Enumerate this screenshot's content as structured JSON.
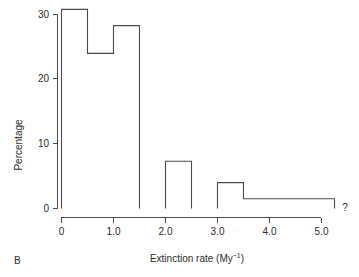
{
  "figure": {
    "panel_label": "B",
    "uncertainty_marker": "?"
  },
  "chart_data": {
    "type": "bar",
    "title": "",
    "subtitle": "",
    "xlabel": "Extinction rate (My⁻¹)",
    "ylabel": "Percentage",
    "xlabel_parts": {
      "main": "Extinction rate (My",
      "superscript": "−1",
      "tail": ")"
    },
    "style": "histogram-outline",
    "grid": false,
    "legend": null,
    "xlim": [
      0,
      5.25
    ],
    "ylim": [
      0,
      31.5
    ],
    "xticks": [
      0,
      1.0,
      2.0,
      3.0,
      4.0,
      5.0
    ],
    "xticklabels": [
      "0",
      "1.0",
      "2.0",
      "3.0",
      "4.0",
      "5.0"
    ],
    "yticks": [
      0,
      10,
      20,
      30
    ],
    "yticklabels": [
      "0",
      "10",
      "20",
      "30"
    ],
    "bin_width": 0.5,
    "bins": [
      {
        "x0": 0.0,
        "x1": 0.5,
        "value": 30.8
      },
      {
        "x0": 0.5,
        "x1": 1.0,
        "value": 24.0
      },
      {
        "x0": 1.0,
        "x1": 1.5,
        "value": 28.3
      },
      {
        "x0": 1.5,
        "x1": 2.0,
        "value": 0.0
      },
      {
        "x0": 2.0,
        "x1": 2.5,
        "value": 7.3
      },
      {
        "x0": 2.5,
        "x1": 3.0,
        "value": 0.0
      },
      {
        "x0": 3.0,
        "x1": 3.5,
        "value": 4.0
      },
      {
        "x0": 3.5,
        "x1": 5.25,
        "value": 1.5
      }
    ],
    "annotations": [
      {
        "text": "?",
        "x": 5.3,
        "y": 1.5
      }
    ]
  }
}
